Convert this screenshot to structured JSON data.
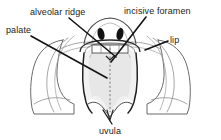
{
  "diagram": {
    "view": "frontal view of open mouth showing hard and soft palate",
    "labels": [
      {
        "id": "alveolar-ridge",
        "text": "alveolar ridge",
        "position": "top-left-center"
      },
      {
        "id": "palate",
        "text": "palate",
        "position": "upper-left"
      },
      {
        "id": "incisive-foramen",
        "text": "incisive foramen",
        "position": "top-right"
      },
      {
        "id": "lip",
        "text": "lip",
        "position": "right"
      },
      {
        "id": "uvula",
        "text": "uvula",
        "position": "bottom-center"
      }
    ],
    "leaders": [
      {
        "id": "leader-alveolar",
        "from": "alveolar ridge",
        "to": "upper tooth row / alveolar arch"
      },
      {
        "id": "leader-palate",
        "from": "palate",
        "to": "hard palate surface"
      },
      {
        "id": "leader-incisive",
        "from": "incisive foramen",
        "to": "anterior midline of palate"
      },
      {
        "id": "leader-lip",
        "from": "lip",
        "to": "right lip margin"
      },
      {
        "id": "leader-uvula",
        "from": "uvula",
        "to": "uvula tip"
      }
    ],
    "colors": {
      "ink": "#1b1b1b",
      "outline": "#4a4a4a",
      "light_outline": "#8c8c8c",
      "palate_fill": "#f0f0f0",
      "palate_fill_inner": "#e6e6e6",
      "nostril": "#111111",
      "background": "#ffffff"
    },
    "features": [
      "nose with two dark nostrils",
      "upper lip and cheeks",
      "alveolar ridge with teeth band",
      "hard palate with dashed midline raphe",
      "soft palate with scalloped lower border",
      "uvula at midline"
    ]
  }
}
